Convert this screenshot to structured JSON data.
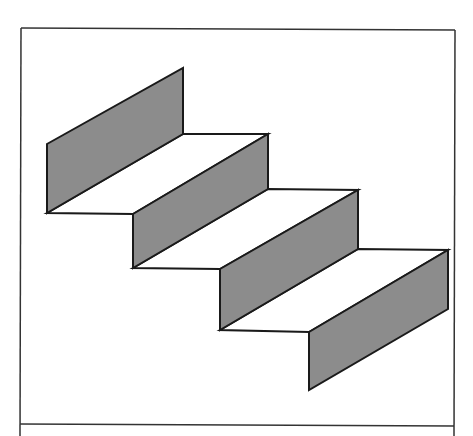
{
  "figure": {
    "colors": {
      "background": "#ffffff",
      "riser_fill": "#8c8c8c",
      "stroke": "#1a1a1a",
      "frame_stroke": "#333333"
    },
    "frame": {
      "left": 21,
      "top": 28,
      "right": 455,
      "bottom": 424
    },
    "risers": [
      {
        "points": "47,144 183,68 183,134 47,213"
      },
      {
        "points": "133,214 268,134 268,189 133,268"
      },
      {
        "points": "220,269 358,190 358,249 220,330"
      },
      {
        "points": "309,332 448,250 448,309 309,390"
      }
    ],
    "treads": [
      {
        "points": "47,213 183,134 268,134 133,214"
      },
      {
        "points": "133,268 268,189 358,190 220,269"
      },
      {
        "points": "220,330 358,249 448,250 309,332"
      }
    ]
  }
}
